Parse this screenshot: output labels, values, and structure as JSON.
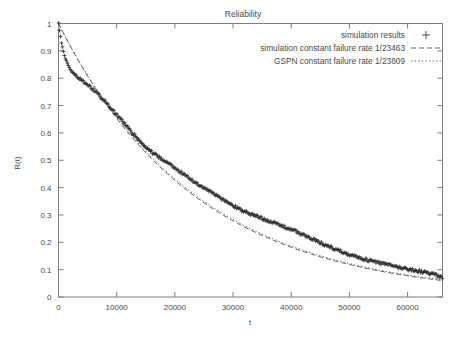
{
  "chart_data": {
    "type": "scatter",
    "title": "Reliability",
    "xlabel": "t",
    "ylabel": "R(t)",
    "xlim": [
      0,
      66000
    ],
    "ylim": [
      0,
      1
    ],
    "grid": false,
    "legend_position": "top-right",
    "xticks": [
      0,
      10000,
      20000,
      30000,
      40000,
      50000,
      60000
    ],
    "xtick_labels": [
      "0",
      "10000",
      "20000",
      "30000",
      "40000",
      "50000",
      "60000"
    ],
    "yticks": [
      0,
      0.1,
      0.2,
      0.3,
      0.4,
      0.5,
      0.6,
      0.7,
      0.8,
      0.9,
      1
    ],
    "ytick_labels": [
      "0",
      "0.1",
      "0.2",
      "0.3",
      "0.4",
      "0.5",
      "0.6",
      "0.7",
      "0.8",
      "0.9",
      "1"
    ],
    "series": [
      {
        "name": "simulation results",
        "marker": "+",
        "style": "points",
        "color": "#2e2e2e",
        "x": [
          0,
          300,
          600,
          900,
          1200,
          1500,
          1800,
          2100,
          2400,
          2700,
          3000,
          3600,
          4200,
          4800,
          5400,
          6000,
          6600,
          7200,
          7800,
          8400,
          9000,
          9600,
          10200,
          10800,
          11400,
          12000,
          12600,
          13200,
          13800,
          14400,
          15000,
          15600,
          16200,
          16800,
          17400,
          18000,
          18600,
          19200,
          19800,
          20400,
          21000,
          21600,
          22200,
          22800,
          23400,
          24000,
          24600,
          25200,
          25800,
          26400,
          27000,
          27600,
          28200,
          28800,
          29400,
          30000,
          30600,
          31200,
          31800,
          32400,
          33000,
          33600,
          34200,
          34800,
          35400,
          36000,
          36600,
          37200,
          37800,
          38400,
          39000,
          39600,
          40200,
          40800,
          41400,
          42000,
          42600,
          43200,
          43800,
          44400,
          45000,
          45600,
          46200,
          46800,
          47400,
          48000,
          48600,
          49200,
          49800,
          50400,
          51000,
          51600,
          52200,
          52800,
          53400,
          54000,
          54600,
          55200,
          55800,
          56400,
          57000,
          57600,
          58200,
          58800,
          59400,
          60000,
          60600,
          61200,
          61800,
          62400,
          63000,
          63600,
          64200,
          64800,
          65400,
          66000
        ],
        "y": [
          1.0,
          0.955,
          0.92,
          0.893,
          0.871,
          0.854,
          0.841,
          0.83,
          0.822,
          0.815,
          0.809,
          0.799,
          0.789,
          0.779,
          0.768,
          0.757,
          0.745,
          0.733,
          0.72,
          0.706,
          0.692,
          0.678,
          0.663,
          0.648,
          0.633,
          0.618,
          0.603,
          0.589,
          0.574,
          0.56,
          0.548,
          0.537,
          0.527,
          0.518,
          0.51,
          0.501,
          0.492,
          0.483,
          0.474,
          0.465,
          0.456,
          0.447,
          0.438,
          0.43,
          0.421,
          0.413,
          0.405,
          0.397,
          0.389,
          0.381,
          0.373,
          0.365,
          0.357,
          0.349,
          0.341,
          0.334,
          0.327,
          0.321,
          0.315,
          0.309,
          0.304,
          0.299,
          0.294,
          0.289,
          0.285,
          0.28,
          0.275,
          0.27,
          0.265,
          0.26,
          0.255,
          0.25,
          0.245,
          0.24,
          0.234,
          0.228,
          0.222,
          0.216,
          0.21,
          0.204,
          0.198,
          0.192,
          0.187,
          0.182,
          0.177,
          0.172,
          0.167,
          0.162,
          0.157,
          0.153,
          0.149,
          0.145,
          0.141,
          0.137,
          0.134,
          0.131,
          0.128,
          0.125,
          0.122,
          0.119,
          0.116,
          0.113,
          0.11,
          0.108,
          0.105,
          0.103,
          0.1,
          0.098,
          0.095,
          0.093,
          0.09,
          0.087,
          0.084,
          0.08,
          0.075,
          0.068
        ]
      },
      {
        "name": "simulation constant failure rate 1/23463",
        "marker": "dashed-line",
        "style": "line",
        "color": "#555555",
        "failure_rate": "1/23463",
        "mttf": 23463,
        "model": "R(t) = exp(-t/23463)"
      },
      {
        "name": "GSPN constant failure rate 1/23809",
        "marker": "dotted-line",
        "style": "line",
        "color": "#555555",
        "failure_rate": "1/23809",
        "mttf": 23809,
        "model": "R(t) = exp(-t/23809)"
      }
    ]
  }
}
